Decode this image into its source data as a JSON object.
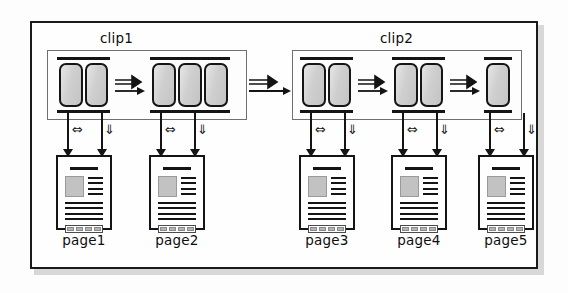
{
  "figure": {
    "type": "diagram",
    "title_visible": false
  },
  "colors": {
    "frame_border": "#1a1a1a",
    "clip_border": "#6f6f6f",
    "cell_fill": "#cfcfcf",
    "cell_border": "#151515",
    "rule": "#141414",
    "page_border": "#141414",
    "page_image_fill": "#c2c2c2",
    "shadow": "#b9b9b9",
    "background": "#fdfdfd"
  },
  "clips": [
    {
      "id": "clip1",
      "label": "clip1",
      "groups": [
        {
          "id": "group1",
          "cells": 2
        },
        {
          "id": "group2",
          "cells": 3
        }
      ]
    },
    {
      "id": "clip2",
      "label": "clip2",
      "groups": [
        {
          "id": "group3",
          "cells": 2
        },
        {
          "id": "group4",
          "cells": 2
        },
        {
          "id": "group5",
          "cells": 1
        }
      ]
    }
  ],
  "flow_arrows": [
    {
      "id": "arrow-g1-g2",
      "from": "group1",
      "to": "group2",
      "style": "double-line-arrow"
    },
    {
      "id": "arrow-clip1-clip2",
      "from": "clip1",
      "to": "clip2",
      "style": "double-line-arrow"
    },
    {
      "id": "arrow-g3-g4",
      "from": "group3",
      "to": "group4",
      "style": "double-line-arrow"
    },
    {
      "id": "arrow-g4-g5",
      "from": "group4",
      "to": "group5",
      "style": "double-line-arrow"
    }
  ],
  "connector_symbols": {
    "bidirectional": "⇔",
    "downward": "⇓"
  },
  "pages": [
    {
      "id": "page1",
      "label": "page1",
      "linked_group": "group1"
    },
    {
      "id": "page2",
      "label": "page2",
      "linked_group": "group2"
    },
    {
      "id": "page3",
      "label": "page3",
      "linked_group": "group3"
    },
    {
      "id": "page4",
      "label": "page4",
      "linked_group": "group4"
    },
    {
      "id": "page5",
      "label": "page5",
      "linked_group": "group5"
    }
  ],
  "page_content": {
    "image_block_present": true,
    "side_line_count": 4,
    "full_width_line_count": 4,
    "footer_cell_count": 4
  }
}
